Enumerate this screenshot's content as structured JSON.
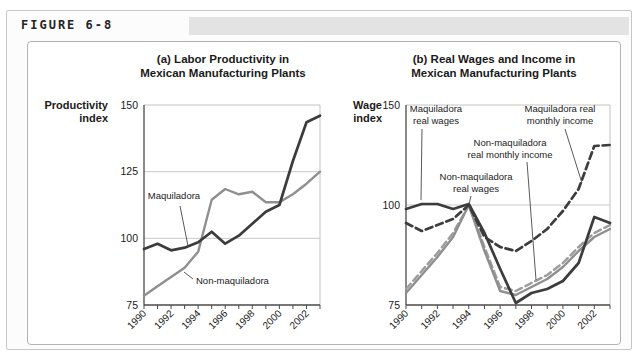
{
  "figure_label": "FIGURE 6-8",
  "charts": {
    "a": {
      "title1": "(a) Labor Productivity in",
      "title2": "Mexican Manufacturing Plants",
      "ylabel1": "Productivity",
      "ylabel2": "index"
    },
    "b": {
      "title1": "(b) Real Wages and Income in",
      "title2": "Mexican Manufacturing Plants",
      "ylabel1": "Wage",
      "ylabel2": "index"
    }
  },
  "chart_data": [
    {
      "id": "chart-a",
      "type": "line",
      "title": "(a) Labor Productivity in Mexican Manufacturing Plants",
      "ylabel": "Productivity index",
      "x": [
        1990,
        1991,
        1992,
        1993,
        1994,
        1995,
        1996,
        1997,
        1998,
        1999,
        2000,
        2001,
        2002,
        2003
      ],
      "xtick_labels": [
        "1990",
        "1992",
        "1994",
        "1996",
        "1998",
        "2000",
        "2002"
      ],
      "ylim": [
        75,
        150
      ],
      "yticks": [
        75,
        100,
        125,
        150
      ],
      "gridlines": [
        100,
        125
      ],
      "grid": "horizontal only",
      "legend_position": "inline annotations",
      "series": [
        {
          "name": "Maquiladora",
          "style": "solid",
          "color": "#3c3c3c",
          "values": [
            96,
            98,
            95.5,
            96.5,
            98.5,
            102.5,
            98,
            101,
            105.5,
            110,
            112.5,
            129,
            143.5,
            146
          ]
        },
        {
          "name": "Non-maquiladora",
          "style": "solid",
          "color": "#8f8f8f",
          "values": [
            78.5,
            82,
            85.5,
            89,
            95,
            114.5,
            118.5,
            116.5,
            117.5,
            113.5,
            113.5,
            116.5,
            120.5,
            125
          ]
        }
      ],
      "annotations": [
        {
          "lines": [
            "Maquiladora"
          ]
        },
        {
          "lines": [
            "Non-maquiladora"
          ]
        }
      ]
    },
    {
      "id": "chart-b",
      "type": "line",
      "title": "(b) Real Wages and Income in Mexican Manufacturing Plants",
      "ylabel": "Wage index",
      "y_scale": "nonlinear: 100 sits at axis midpoint between 75 and 150",
      "x": [
        1990,
        1991,
        1992,
        1993,
        1994,
        1995,
        1996,
        1997,
        1998,
        1999,
        2000,
        2001,
        2002,
        2003
      ],
      "xtick_labels": [
        "1990",
        "1992",
        "1994",
        "1996",
        "1998",
        "2000",
        "2002"
      ],
      "ylim": [
        75,
        150
      ],
      "yticks": [
        75,
        100,
        150
      ],
      "gridlines": [
        100
      ],
      "grid": "horizontal only",
      "legend_position": "inline annotations",
      "series": [
        {
          "name": "Maquiladora real wages",
          "style": "solid",
          "color": "#3c3c3c",
          "values": [
            99,
            100.5,
            100.5,
            99,
            100.5,
            93,
            84,
            75.5,
            78,
            79,
            81,
            85.5,
            97,
            95.5
          ]
        },
        {
          "name": "Maquiladora real monthly income",
          "style": "dashed",
          "color": "#3c3c3c",
          "values": [
            95.5,
            93.5,
            95,
            96.5,
            100,
            92,
            89.5,
            88.5,
            91,
            94,
            98.5,
            108,
            129.5,
            130
          ]
        },
        {
          "name": "Non-maquiladora real wages",
          "style": "solid",
          "color": "#8f8f8f",
          "values": [
            78,
            82.5,
            87,
            92,
            100,
            88.5,
            78.5,
            77.5,
            79.5,
            81.5,
            84.5,
            88.5,
            92,
            94
          ]
        },
        {
          "name": "Non-maquiladora real monthly income",
          "style": "dashed",
          "color": "#9c9c9c",
          "values": [
            79,
            83.5,
            88,
            93,
            100,
            89.5,
            79.5,
            78.5,
            80.5,
            82.5,
            85.5,
            89.5,
            93,
            95
          ]
        }
      ],
      "annotations": [
        {
          "lines": [
            "Maquiladora",
            "real wages"
          ]
        },
        {
          "lines": [
            "Maquiladora real",
            "monthly income"
          ]
        },
        {
          "lines": [
            "Non-maquiladora",
            "real monthly income"
          ]
        },
        {
          "lines": [
            "Non-maquiladora",
            "real wages"
          ]
        }
      ]
    }
  ],
  "colors": {
    "dark_line": "#3c3c3c",
    "gray_line": "#8f8f8f",
    "dashed_gray_line": "#9c9c9c",
    "gridline": "#c9c9c9",
    "axis": "#4a4a4a",
    "panel_border": "#b2b2b2",
    "header_band": "#e3e3e3",
    "text": "#1a1a1a"
  }
}
